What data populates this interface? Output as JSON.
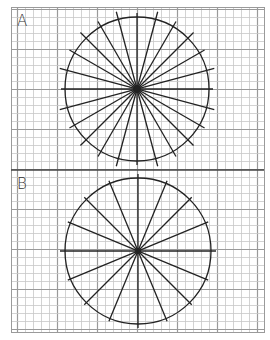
{
  "figure": {
    "background": "#ffffff",
    "grid": {
      "left": 11,
      "top": 7,
      "right": 264,
      "bottom": 332,
      "minor_step": 8,
      "major_every": 5,
      "minor_color": "#c8c8c8",
      "major_color": "#9a9a9a"
    },
    "divider": {
      "y": 170,
      "color": "#444444"
    },
    "panels": [
      {
        "label": "A",
        "label_pos": {
          "x": 17,
          "y": 14
        },
        "center": {
          "x": 137,
          "y": 89
        },
        "radius": 72,
        "diameters": 12,
        "angle_step_deg": 15,
        "ray_lengths": [
          76,
          80,
          78,
          80,
          78,
          80,
          76,
          80,
          78,
          80,
          78,
          80
        ],
        "stroke": "#222222",
        "description": "Circle divided into 24 equal sectors by 12 diameters at 15° intervals"
      },
      {
        "label": "B",
        "label_pos": {
          "x": 17,
          "y": 177
        },
        "center": {
          "x": 138,
          "y": 251
        },
        "radius": 73,
        "diameters": 8,
        "angle_step_deg": 22.5,
        "ray_lengths": [
          78,
          76,
          76,
          76,
          77,
          76,
          76,
          76
        ],
        "stroke": "#222222",
        "description": "Circle divided into 16 equal sectors by 8 diameters at 22.5° intervals"
      }
    ]
  }
}
